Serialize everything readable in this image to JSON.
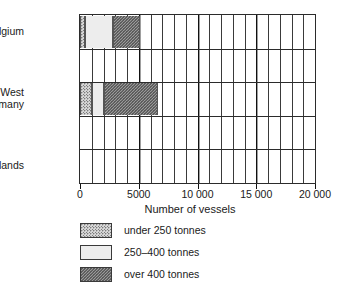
{
  "chart_data": {
    "type": "bar",
    "orientation": "horizontal",
    "stacked": true,
    "title": "",
    "xlabel": "Number of vessels",
    "ylabel": "",
    "xlim": [
      0,
      20000
    ],
    "xticks": [
      0,
      5000,
      10000,
      15000,
      20000
    ],
    "xtick_labels": [
      "0",
      "5000",
      "10 000",
      "15 000",
      "20 000"
    ],
    "minor_tick_step": 1000,
    "grid": "vertical gridlines every 1000, heavier every 5000; horizontal band lines every row",
    "legend_position": "below plot, left aligned",
    "categories": [
      "Belgium",
      "West Germany",
      "Netherlands"
    ],
    "series": [
      {
        "name": "under 250 tonnes",
        "color": "#d6d6d6",
        "pattern": "fine dotted",
        "values": [
          400,
          1000,
          0
        ]
      },
      {
        "name": "250–400 tonnes",
        "color": "#ededed",
        "pattern": "plain light",
        "values": [
          2400,
          1000,
          0
        ]
      },
      {
        "name": "over 400 tonnes",
        "color": "#9a9a9a",
        "pattern": "coarse dotted",
        "values": [
          2300,
          4600,
          0
        ]
      }
    ],
    "totals": [
      5100,
      6600,
      0
    ]
  },
  "plot": {
    "rows": [
      {
        "label_lines": [
          "Belgium"
        ],
        "name": "belgium"
      },
      {
        "label_lines": [
          ""
        ],
        "name": "blank-row-1"
      },
      {
        "label_lines": [
          "West",
          "Germany"
        ],
        "name": "west-germany"
      },
      {
        "label_lines": [
          ""
        ],
        "name": "blank-row-2"
      },
      {
        "label_lines": [
          "Netherlands"
        ],
        "name": "netherlands"
      }
    ],
    "bars": [
      {
        "row": 0,
        "name": "belgium",
        "segments": [
          {
            "series": "under 250 tonnes",
            "start": 0,
            "end": 400,
            "fill": "fill-under250"
          },
          {
            "series": "250–400 tonnes",
            "start": 400,
            "end": 2800,
            "fill": "fill-250to400"
          },
          {
            "series": "over 400 tonnes",
            "start": 2800,
            "end": 5100,
            "fill": "fill-over400"
          }
        ]
      },
      {
        "row": 2,
        "name": "west-germany",
        "segments": [
          {
            "series": "under 250 tonnes",
            "start": 0,
            "end": 1000,
            "fill": "fill-under250"
          },
          {
            "series": "250–400 tonnes",
            "start": 1000,
            "end": 2000,
            "fill": "fill-250to400"
          },
          {
            "series": "over 400 tonnes",
            "start": 2000,
            "end": 6600,
            "fill": "fill-over400"
          }
        ]
      },
      {
        "row": 4,
        "name": "netherlands",
        "segments": []
      }
    ]
  },
  "axis": {
    "title": "Number of vessels",
    "ticks": [
      {
        "value": 0,
        "label": "0"
      },
      {
        "value": 5000,
        "label": "5000"
      },
      {
        "value": 10000,
        "label": "10 000"
      },
      {
        "value": 15000,
        "label": "15 000"
      },
      {
        "value": 20000,
        "label": "20 000"
      }
    ]
  },
  "legend": {
    "items": [
      {
        "label": "under 250 tonnes",
        "fill": "fill-under250",
        "name": "legend-under-250"
      },
      {
        "label": "250–400 tonnes",
        "fill": "fill-250to400",
        "name": "legend-250-400"
      },
      {
        "label": "over 400 tonnes",
        "fill": "fill-over400",
        "name": "legend-over-400"
      }
    ]
  }
}
